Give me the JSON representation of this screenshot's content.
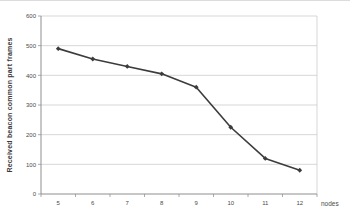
{
  "figure": {
    "background": "#ffffff",
    "top_border_color": "#dcdcdc"
  },
  "chart_data": {
    "type": "line",
    "title": "",
    "xlabel": "nodes",
    "ylabel": "Received beacon common part frames",
    "categories": [
      5,
      6,
      7,
      8,
      9,
      10,
      11,
      12
    ],
    "values": [
      490,
      455,
      430,
      405,
      360,
      225,
      120,
      80
    ],
    "ylim": [
      0,
      600
    ],
    "ytick_interval": 100,
    "yticks": [
      0,
      100,
      200,
      300,
      400,
      500,
      600
    ],
    "grid": "horizontal",
    "legend": "none",
    "marker": "diamond",
    "colors": {
      "line": "#3c3c3c",
      "marker": "#3c3c3c",
      "gridline": "#c9c9c9",
      "axis": "#8e8e8e",
      "tick_label": "#4a4a4a"
    }
  }
}
